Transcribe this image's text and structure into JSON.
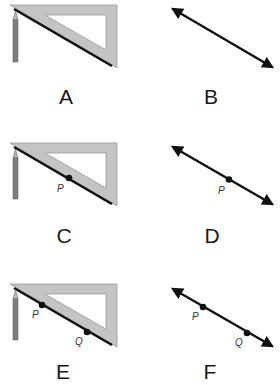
{
  "figure": {
    "colors": {
      "set_square_fill": "#c4c4c4",
      "set_square_edge": "#9a9a9a",
      "pencil_body": "#7d7d7d",
      "pencil_tip": "#b9b9b9",
      "line": "#111111",
      "text": "#1a1a1a"
    },
    "panels": [
      {
        "id": "A",
        "label": "A",
        "kind": "set-square-with-pencil",
        "points": []
      },
      {
        "id": "B",
        "label": "B",
        "kind": "line-with-arrows",
        "points": []
      },
      {
        "id": "C",
        "label": "C",
        "kind": "set-square-with-pencil",
        "points": [
          {
            "name": "P",
            "label": "P"
          }
        ]
      },
      {
        "id": "D",
        "label": "D",
        "kind": "line-with-arrows",
        "points": [
          {
            "name": "P",
            "label": "P"
          }
        ]
      },
      {
        "id": "E",
        "label": "E",
        "kind": "set-square-with-pencil",
        "points": [
          {
            "name": "P",
            "label": "P"
          },
          {
            "name": "Q",
            "label": "Q"
          }
        ]
      },
      {
        "id": "F",
        "label": "F",
        "kind": "line-with-arrows",
        "points": [
          {
            "name": "P",
            "label": "P"
          },
          {
            "name": "Q",
            "label": "Q"
          }
        ]
      }
    ]
  }
}
